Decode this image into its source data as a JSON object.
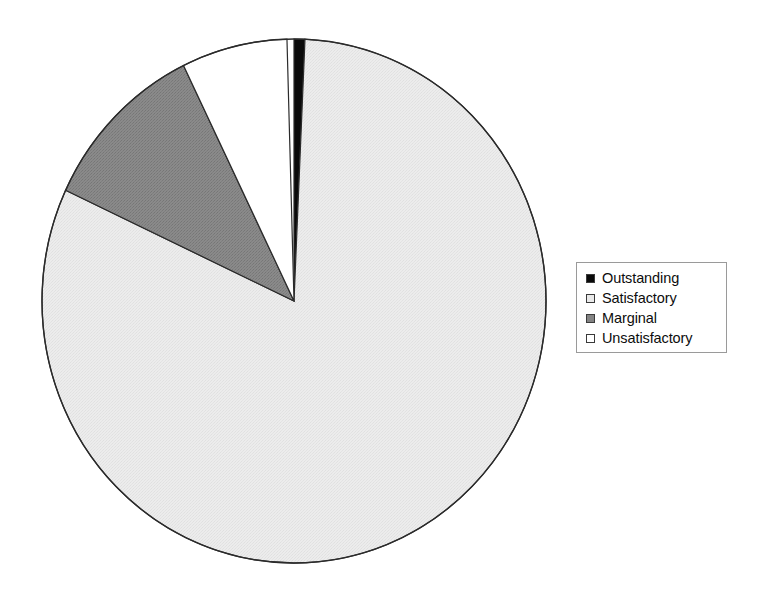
{
  "chart_data": {
    "type": "pie",
    "title": "",
    "subtitle": "",
    "xlabel": "",
    "ylabel": "",
    "legend_position": "right",
    "grid": false,
    "start_angle_deg": 0,
    "direction": "clockwise",
    "categories": [
      "Outstanding",
      "Satisfactory",
      "Marginal",
      "Unsatisfactory"
    ],
    "values": [
      0.7,
      81.3,
      10.8,
      7.2
    ],
    "units": "percent",
    "slices": [
      {
        "label": "Outstanding",
        "value": 0.7,
        "percent": "0.7%",
        "color": "#0a0a0a",
        "start_angle_deg": 0.0,
        "end_angle_deg": 2.5,
        "sweep_deg": 2.5
      },
      {
        "label": "Satisfactory",
        "value": 81.3,
        "percent": "81.3%",
        "color": "#e9e9e9",
        "start_angle_deg": 2.5,
        "end_angle_deg": 295.0,
        "sweep_deg": 292.5
      },
      {
        "label": "Marginal",
        "value": 10.8,
        "percent": "10.8%",
        "color": "#848484",
        "start_angle_deg": 295.0,
        "end_angle_deg": 334.0,
        "sweep_deg": 39.0
      },
      {
        "label": "Unsatisfactory",
        "value": 7.2,
        "percent": "7.2%",
        "color": "#ffffff",
        "start_angle_deg": 334.0,
        "end_angle_deg": 358.4,
        "sweep_deg": 24.4
      }
    ]
  },
  "pie": {
    "center_x": 294,
    "center_y": 301,
    "radius_x": 252,
    "radius_y": 262,
    "outline_color": "#2b2b2b",
    "outline_width": 1.4
  },
  "legend": {
    "border_color": "#9a9a9a",
    "background": "#ffffff",
    "items": [
      {
        "label": "Outstanding",
        "swatch_color": "#0a0a0a",
        "swatch_name": "legend-swatch-outstanding"
      },
      {
        "label": "Satisfactory",
        "swatch_color": "#e9e9e9",
        "swatch_name": "legend-swatch-satisfactory"
      },
      {
        "label": "Marginal",
        "swatch_color": "#848484",
        "swatch_name": "legend-swatch-marginal"
      },
      {
        "label": "Unsatisfactory",
        "swatch_color": "#ffffff",
        "swatch_name": "legend-swatch-unsatisfactory"
      }
    ]
  },
  "canvas": {
    "width": 760,
    "height": 596,
    "background": "#ffffff"
  }
}
